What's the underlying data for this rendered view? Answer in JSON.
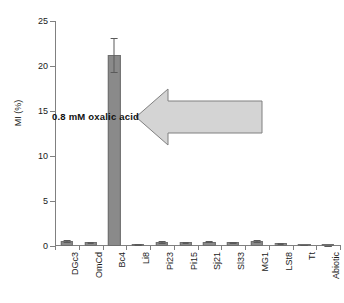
{
  "chart_data": {
    "type": "bar",
    "title": "",
    "xlabel": "",
    "ylabel": "MI (%)",
    "ylim": [
      0,
      25
    ],
    "yticks": [
      0,
      5,
      10,
      15,
      20,
      25
    ],
    "grid": false,
    "legend": "none",
    "categories": [
      "DGc3",
      "OmCd",
      "Bc4",
      "Li8",
      "Pi23",
      "Pi15",
      "Sj21",
      "Sl33",
      "MG1",
      "LSt8",
      "Tt",
      "Abiotic"
    ],
    "values": [
      0.55,
      0.4,
      21.2,
      0.15,
      0.45,
      0.4,
      0.5,
      0.4,
      0.55,
      0.3,
      0.12,
      0.02
    ],
    "errors": [
      0.12,
      0.08,
      1.9,
      0.05,
      0.1,
      0.08,
      0.1,
      0.08,
      0.12,
      0.07,
      0.04,
      0.01
    ],
    "annotations": [
      {
        "text": "0.8 mM oxalic acid",
        "shape": "left-arrow",
        "fill": "#d4d4d4",
        "stroke": "#808080"
      }
    ],
    "colors": {
      "bar_fill": "#8a8a8a",
      "bar_edge": "#6e6e6e",
      "axis": "#808080",
      "text": "#1a1a1a",
      "background": "#ffffff"
    }
  },
  "axis": {
    "y_label": "MI (%)",
    "y_tick_labels": [
      "0",
      "5",
      "10",
      "15",
      "20",
      "25"
    ],
    "x_tick_labels": [
      "DGc3",
      "OmCd",
      "Bc4",
      "Li8",
      "Pi23",
      "Pi15",
      "Sj21",
      "Sl33",
      "MG1",
      "LSt8",
      "Tt",
      "Abiotic"
    ]
  },
  "annotation": {
    "arrow_text": "0.8 mM oxalic acid"
  }
}
